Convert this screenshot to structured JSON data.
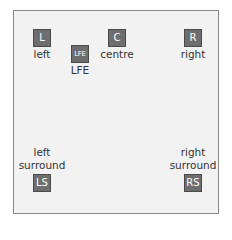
{
  "diagram": {
    "colors": {
      "background": "#f2f2f2",
      "border": "#8a8a8a",
      "box": "#6e6e6e",
      "box_text": "#ffffff",
      "label_text": "#333333"
    },
    "speakers": [
      {
        "id": "L",
        "label": "left"
      },
      {
        "id": "LFE",
        "label": "LFE"
      },
      {
        "id": "C",
        "label": "centre"
      },
      {
        "id": "R",
        "label": "right"
      },
      {
        "id": "LS",
        "label_line1": "left",
        "label_line2": "surround"
      },
      {
        "id": "RS",
        "label_line1": "right",
        "label_line2": "surround"
      }
    ]
  }
}
